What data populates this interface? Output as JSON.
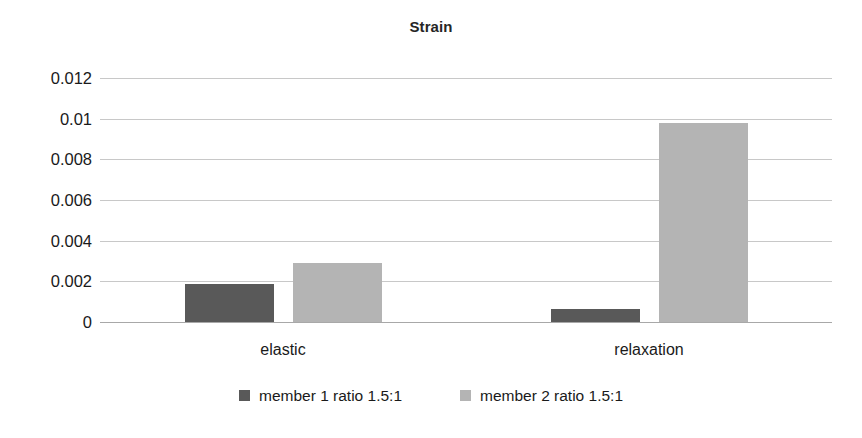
{
  "chart_data": {
    "type": "bar",
    "title": "Strain",
    "xlabel": "",
    "ylabel": "",
    "categories": [
      "elastic",
      "relaxation"
    ],
    "series": [
      {
        "name": "member 1 ratio 1.5:1",
        "color": "#595959",
        "values": [
          0.00185,
          0.00065
        ]
      },
      {
        "name": "member 2 ratio 1.5:1",
        "color": "#b4b4b4",
        "values": [
          0.0029,
          0.00978
        ]
      }
    ],
    "ylim": [
      0,
      0.012
    ],
    "yticks": [
      0,
      0.002,
      0.004,
      0.006,
      0.008,
      0.01,
      0.012
    ],
    "ytick_labels": [
      "0",
      "0.002",
      "0.004",
      "0.006",
      "0.008",
      "0.01",
      "0.012"
    ],
    "grid": true,
    "legend_position": "bottom"
  }
}
